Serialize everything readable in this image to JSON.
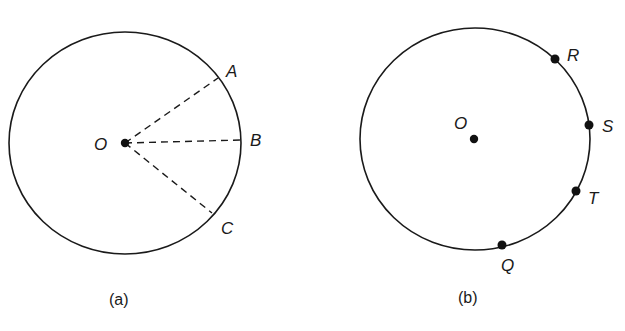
{
  "figures": [
    {
      "caption": "(a)",
      "center_label": "O",
      "points": [
        {
          "label": "A"
        },
        {
          "label": "B"
        },
        {
          "label": "C"
        }
      ],
      "radii_style": "dashed"
    },
    {
      "caption": "(b)",
      "center_label": "O",
      "points": [
        {
          "label": "R"
        },
        {
          "label": "S"
        },
        {
          "label": "T"
        },
        {
          "label": "Q"
        }
      ]
    }
  ],
  "colors": {
    "stroke": "#1a1a1a",
    "background": "#ffffff"
  }
}
